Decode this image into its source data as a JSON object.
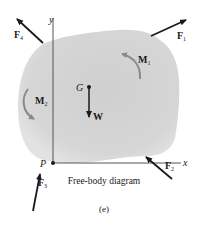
{
  "diagram": {
    "caption": "Free-body diagram",
    "figure_label": "(e)",
    "axes": {
      "x_label": "x",
      "y_label": "y"
    },
    "points": {
      "origin": "P",
      "center_of_gravity": "G"
    },
    "forces": {
      "f1": {
        "main": "F",
        "sub": "1"
      },
      "f2": {
        "main": "F",
        "sub": "2"
      },
      "f3": {
        "main": "F",
        "sub": "3"
      },
      "f4": {
        "main": "F",
        "sub": "4"
      },
      "weight": "W"
    },
    "moments": {
      "m1": {
        "main": "M",
        "sub": "1"
      },
      "m2": {
        "main": "M",
        "sub": "2"
      }
    },
    "colors": {
      "body_fill": "#d4d4d4",
      "body_edge": "#e6e6e6",
      "arrow": "#1a1a1a",
      "moment_arrow": "#8a8a8a",
      "axis": "#555555"
    }
  }
}
